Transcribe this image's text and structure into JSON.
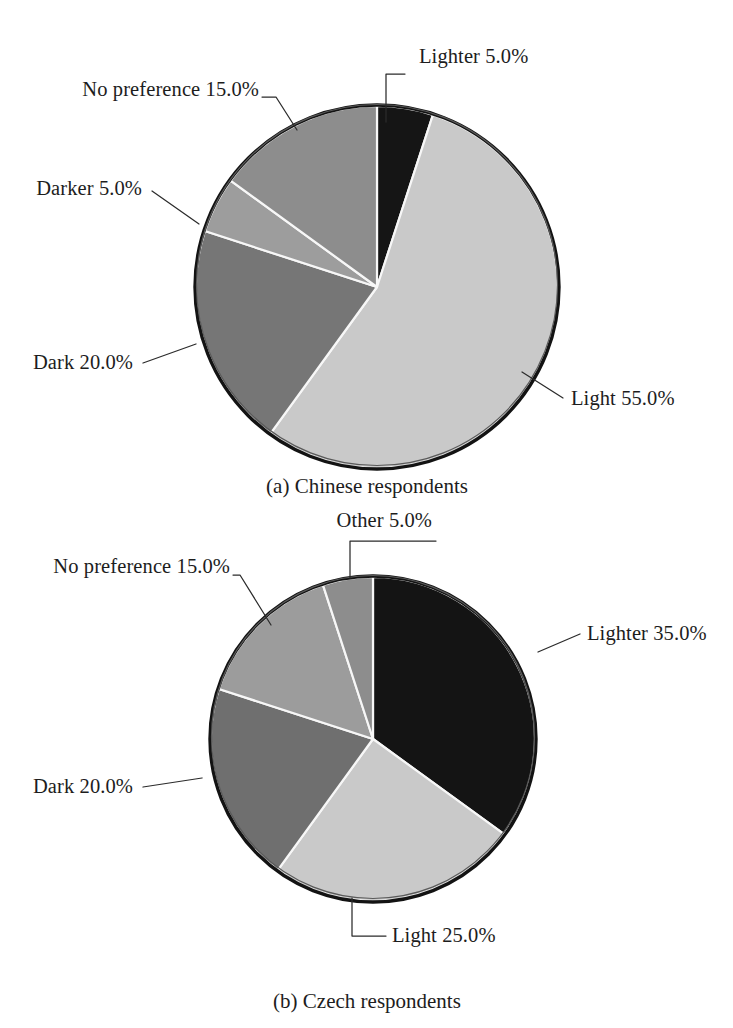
{
  "figure": {
    "background": "#ffffff",
    "label_color": "#1d1d1d",
    "leader_color": "#2b2b2b",
    "slice_edge_color": "#f7f7f7"
  },
  "chart_data": [
    {
      "type": "pie",
      "id": "chinese-respondents",
      "title": "",
      "caption": "(a) Chinese respondents",
      "labels": [
        "Lighter",
        "Light",
        "Dark",
        "Darker",
        "No preference"
      ],
      "values": [
        5.0,
        55.0,
        20.0,
        5.0,
        15.0
      ],
      "value_unit": "%",
      "start_angle_deg": 0,
      "direction": "clockwise",
      "legend": "callout-labels",
      "data_labels": [
        "Lighter 5.0%",
        "Light 55.0%",
        "Dark 20.0%",
        "Darker 5.0%",
        "No preference 15.0%"
      ],
      "slice_colors": [
        "#151515",
        "#c9c9c9",
        "#767676",
        "#9d9d9d",
        "#8d8d8d"
      ],
      "annotations": [
        {
          "text": "Lighter 5.0%",
          "align": "right",
          "tx": 419,
          "ty": 63,
          "path": "M 386,122 L 386,74 L 405,74",
          "value": 5.0
        },
        {
          "text": "No preference 15.0%",
          "align": "left",
          "tx": 259,
          "ty": 96,
          "path": "M 297,130 L 276,97 L 262,97",
          "value": 15.0
        },
        {
          "text": "Darker 5.0%",
          "align": "left",
          "tx": 142,
          "ty": 195,
          "path": "M 199,224 L 152,191",
          "value": 5.0
        },
        {
          "text": "Dark 20.0%",
          "align": "left",
          "tx": 133,
          "ty": 369,
          "path": "M 196,344 L 143,363",
          "value": 20.0
        },
        {
          "text": "Light 55.0%",
          "align": "right",
          "tx": 571,
          "ty": 405,
          "path": "M 522,372 L 563,398",
          "value": 55.0
        }
      ]
    },
    {
      "type": "pie",
      "id": "czech-respondents",
      "title": "",
      "caption": "(b) Czech respondents",
      "labels": [
        "Lighter",
        "Light",
        "Dark",
        "No preference",
        "Other"
      ],
      "values": [
        35.0,
        25.0,
        20.0,
        15.0,
        5.0
      ],
      "value_unit": "%",
      "start_angle_deg": 0,
      "direction": "clockwise",
      "legend": "callout-labels",
      "data_labels": [
        "Lighter 35.0%",
        "Light 25.0%",
        "Dark 20.0%",
        "No preference 15.0%",
        "Other 5.0%"
      ],
      "slice_colors": [
        "#141414",
        "#c9c9c9",
        "#6f6f6f",
        "#9c9c9c",
        "#8d8d8d"
      ],
      "annotations": [
        {
          "text": "Other 5.0%",
          "align": "left",
          "tx": 432,
          "ty": 527,
          "path": "M 350,578 L 350,541 L 436,541",
          "value": 5.0
        },
        {
          "text": "No preference 15.0%",
          "align": "left",
          "tx": 230,
          "ty": 573,
          "path": "M 271,625 L 240,575 L 233,575",
          "value": 15.0
        },
        {
          "text": "Dark 20.0%",
          "align": "left",
          "tx": 133,
          "ty": 793,
          "path": "M 202,778 L 143,787",
          "value": 20.0
        },
        {
          "text": "Lighter 35.0%",
          "align": "right",
          "tx": 587,
          "ty": 640,
          "path": "M 538,652 L 580,634",
          "value": 35.0
        },
        {
          "text": "Light 25.0%",
          "align": "right",
          "tx": 392,
          "ty": 942,
          "path": "M 352,898 L 352,936 L 386,936",
          "value": 25.0
        }
      ]
    }
  ],
  "captions": {
    "a": "(a) Chinese respondents",
    "b": "(b) Czech respondents"
  }
}
